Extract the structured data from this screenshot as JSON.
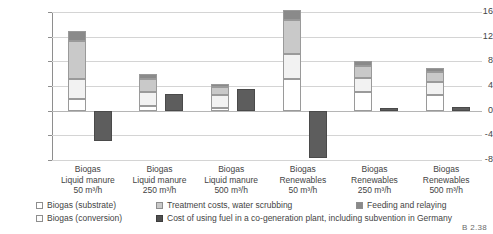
{
  "chart_data": {
    "type": "bar",
    "title": "",
    "xlabel": "",
    "ylabel": "Production costs [ct/kWh]",
    "ylim": [
      -8,
      16
    ],
    "yticks": [
      16,
      12,
      8,
      4,
      0,
      -4,
      -8
    ],
    "ytick_labels": [
      "16",
      "12",
      "8",
      "4",
      "0",
      "-4",
      "-8"
    ],
    "grid": true,
    "stacked": true,
    "legend_position": "bottom",
    "categories": [
      "Biogas Liquid manure 50 m³/h",
      "Biogas Liquid manure 250 m³/h",
      "Biogas Liquid manure 500 m³/h",
      "Biogas Renewables 50 m³/h",
      "Biogas Renewables 250 m³/h",
      "Biogas Renewables 500 m³/h"
    ],
    "series": [
      {
        "name": "Biogas (substrate)",
        "values": [
          1.9,
          0.7,
          0.5,
          5.1,
          3.0,
          2.6
        ]
      },
      {
        "name": "Biogas (conversion)",
        "values": [
          3.2,
          2.4,
          2.1,
          4.1,
          2.3,
          2.0
        ]
      },
      {
        "name": "Treatment costs, water scrubbing",
        "values": [
          6.2,
          2.1,
          1.2,
          5.5,
          1.9,
          1.6
        ]
      },
      {
        "name": "Feeding and relaying",
        "values": [
          1.6,
          0.8,
          0.5,
          1.7,
          0.9,
          0.8
        ]
      },
      {
        "name": "Cost of using fuel in a co-generation plant, including subvention in Germany",
        "values": [
          -5.0,
          2.7,
          3.5,
          -7.6,
          0.4,
          0.6
        ]
      }
    ]
  },
  "axis": {
    "y_title": "Production costs [ct/kWh]",
    "ticks": [
      {
        "value": 16,
        "label": "16"
      },
      {
        "value": 12,
        "label": "12"
      },
      {
        "value": 8,
        "label": "8"
      },
      {
        "value": 4,
        "label": "4"
      },
      {
        "value": 0,
        "label": "0"
      },
      {
        "value": -4,
        "label": "-4"
      },
      {
        "value": -8,
        "label": "-8"
      }
    ]
  },
  "categories": [
    {
      "line1": "Biogas",
      "line2": "Liquid manure",
      "line3": "50 m³/h"
    },
    {
      "line1": "Biogas",
      "line2": "Liquid manure",
      "line3": "250 m³/h"
    },
    {
      "line1": "Biogas",
      "line2": "Liquid manure",
      "line3": "500 m³/h"
    },
    {
      "line1": "Biogas",
      "line2": "Renewables",
      "line3": "50 m³/h"
    },
    {
      "line1": "Biogas",
      "line2": "Renewables",
      "line3": "250 m³/h"
    },
    {
      "line1": "Biogas",
      "line2": "Renewables",
      "line3": "500 m³/h"
    }
  ],
  "legend": {
    "items": [
      {
        "key": "substrate",
        "label": "Biogas (substrate)",
        "color": "#ffffff"
      },
      {
        "key": "conversion",
        "label": "Biogas (conversion)",
        "color": "#fcfcfc"
      },
      {
        "key": "treatment",
        "label": "Treatment costs, water scrubbing",
        "color": "#c9c9c9"
      },
      {
        "key": "feeding",
        "label": "Feeding and relaying",
        "color": "#8a8a8a"
      },
      {
        "key": "fuel",
        "label": "Cost of using fuel in a co-generation plant, including subvention in Germany",
        "color": "#4f4f4f"
      }
    ]
  },
  "footer": {
    "code": "B 2.38"
  }
}
